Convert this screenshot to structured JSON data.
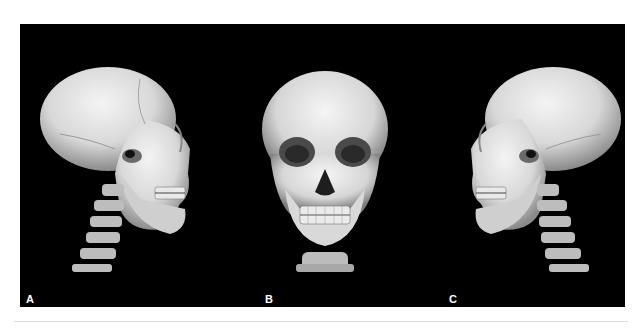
{
  "figure": {
    "background_color": "#000000",
    "bone_color": "#e4e4e4",
    "panels": [
      {
        "label": "A",
        "view": "left lateral 3D CT reconstruction of skull and cervical spine"
      },
      {
        "label": "B",
        "view": "frontal 3D CT reconstruction of skull"
      },
      {
        "label": "C",
        "view": "right lateral 3D CT reconstruction of skull and cervical spine"
      }
    ]
  }
}
